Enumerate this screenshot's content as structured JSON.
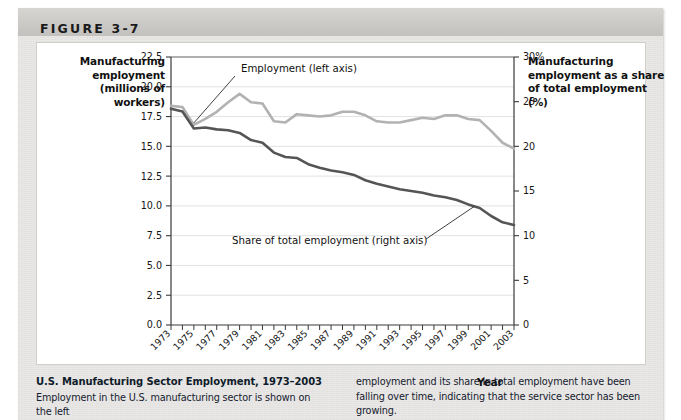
{
  "figure": {
    "label": "FIGURE 3-7"
  },
  "axis_titles": {
    "left": "Manufacturing employment (millions of workers)",
    "right": "Manufacturing employment as a share of total employment (%)",
    "x": "Year"
  },
  "caption": {
    "title": "U.S. Manufacturing Sector Employment, 1973–2003",
    "left_body": "Employment in the U.S. manufacturing sector is shown on the left",
    "right_body": "employment and its share in total employment have been falling over time, indicating that the service sector has been growing."
  },
  "chart_data": {
    "type": "line",
    "title": "U.S. Manufacturing Sector Employment, 1973–2003",
    "xlabel": "Year",
    "ylabel": "Manufacturing employment (millions of workers)",
    "y2label": "Manufacturing employment as a share of total employment (%)",
    "xlim": [
      1973,
      2003
    ],
    "ylim": [
      0.0,
      22.5
    ],
    "y2lim": [
      0,
      30
    ],
    "grid": true,
    "legend": "annotations",
    "x": [
      1973,
      1974,
      1975,
      1976,
      1977,
      1978,
      1979,
      1980,
      1981,
      1982,
      1983,
      1984,
      1985,
      1986,
      1987,
      1988,
      1989,
      1990,
      1991,
      1992,
      1993,
      1994,
      1995,
      1996,
      1997,
      1998,
      1999,
      2000,
      2001,
      2002,
      2003
    ],
    "x_tick_labels": [
      "1973",
      "1975",
      "1977",
      "1979",
      "1981",
      "1983",
      "1985",
      "1987",
      "1989",
      "1991",
      "1993",
      "1995",
      "1997",
      "1999",
      "2001",
      "2003"
    ],
    "y_tick_labels": [
      "0.0",
      "2.5",
      "5.0",
      "7.5",
      "10.0",
      "12.5",
      "15.0",
      "17.5",
      "20.0",
      "22.5"
    ],
    "y2_tick_labels": [
      "0",
      "5",
      "10",
      "15",
      "20",
      "25",
      "30%"
    ],
    "series": [
      {
        "name": "Employment (left axis)",
        "axis": "left",
        "color": "#b2b2b2",
        "annotation": "Employment (left axis)",
        "values": [
          18.4,
          18.3,
          16.8,
          17.3,
          17.9,
          18.7,
          19.4,
          18.7,
          18.6,
          17.1,
          17.0,
          17.7,
          17.6,
          17.5,
          17.6,
          17.9,
          17.9,
          17.6,
          17.1,
          17.0,
          17.0,
          17.2,
          17.4,
          17.3,
          17.6,
          17.6,
          17.3,
          17.2,
          16.3,
          15.3,
          14.8
        ]
      },
      {
        "name": "Share of total employment (right axis)",
        "axis": "right",
        "color": "#555555",
        "annotation": "Share of total employment (right axis)",
        "values": [
          24.2,
          23.9,
          22.0,
          22.1,
          21.9,
          21.8,
          21.5,
          20.7,
          20.4,
          19.3,
          18.8,
          18.7,
          18.0,
          17.6,
          17.3,
          17.1,
          16.8,
          16.2,
          15.8,
          15.5,
          15.2,
          15.0,
          14.8,
          14.5,
          14.3,
          14.0,
          13.5,
          13.1,
          12.2,
          11.5,
          11.2
        ]
      }
    ],
    "annotations": [
      {
        "text": "Employment (left axis)",
        "target_year": 1975,
        "target_value": 16.8
      },
      {
        "text": "Share of total employment (right axis)",
        "target_year": 1999,
        "target_value": 13.5
      }
    ]
  }
}
